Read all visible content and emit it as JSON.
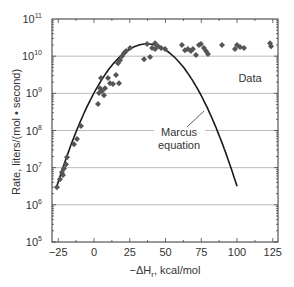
{
  "chart_data": {
    "type": "scatter",
    "title": "",
    "xlabel": "−ΔH",
    "xlabel_sub": "r",
    "xlabel_suffix": ", kcal/mol",
    "ylabel": "Rate, liters/(mol • second)",
    "xlim": [
      -25,
      125
    ],
    "ylim_log10": [
      5,
      11
    ],
    "yscale": "log",
    "grid": "horizontal major",
    "xticks": [
      -25,
      0,
      25,
      50,
      75,
      100,
      125
    ],
    "xtick_labels": [
      "−25",
      "0",
      "25",
      "50",
      "75",
      "100",
      "125"
    ],
    "yticks_log10": [
      5,
      6,
      7,
      8,
      9,
      10,
      11
    ],
    "ytick_labels": [
      {
        "base": "10",
        "exp": "5"
      },
      {
        "base": "10",
        "exp": "6"
      },
      {
        "base": "10",
        "exp": "7"
      },
      {
        "base": "10",
        "exp": "8"
      },
      {
        "base": "10",
        "exp": "9"
      },
      {
        "base": "10",
        "exp": "10"
      },
      {
        "base": "10",
        "exp": "11"
      }
    ],
    "series": [
      {
        "name": "Data",
        "kind": "scatter",
        "marker": "diamond",
        "color": "#555555",
        "points_x_log10y": [
          [
            -25.9,
            6.47
          ],
          [
            -23.8,
            6.69
          ],
          [
            -22.4,
            6.88
          ],
          [
            -21.7,
            6.8
          ],
          [
            -21.0,
            6.98
          ],
          [
            -19.6,
            7.09
          ],
          [
            -18.9,
            7.28
          ],
          [
            -14.0,
            7.63
          ],
          [
            -11.9,
            7.77
          ],
          [
            -9.1,
            8.12
          ],
          [
            2.8,
            8.71
          ],
          [
            3.5,
            9.01
          ],
          [
            4.2,
            9.14
          ],
          [
            5.6,
            9.06
          ],
          [
            7.0,
            8.95
          ],
          [
            7.7,
            9.14
          ],
          [
            4.9,
            9.41
          ],
          [
            9.8,
            9.41
          ],
          [
            11.2,
            9.27
          ],
          [
            13.3,
            9.25
          ],
          [
            15.4,
            9.49
          ],
          [
            17.5,
            9.27
          ],
          [
            16.8,
            9.81
          ],
          [
            18.2,
            9.89
          ],
          [
            19.6,
            10.0
          ],
          [
            21.0,
            10.08
          ],
          [
            22.4,
            10.14
          ],
          [
            25.2,
            10.22
          ],
          [
            35.0,
            9.92
          ],
          [
            39.2,
            9.98
          ],
          [
            37.1,
            10.33
          ],
          [
            40.6,
            10.22
          ],
          [
            42.7,
            10.35
          ],
          [
            42.7,
            10.19
          ],
          [
            44.8,
            10.27
          ],
          [
            46.9,
            10.22
          ],
          [
            49.7,
            10.19
          ],
          [
            61.5,
            10.3
          ],
          [
            63.6,
            10.16
          ],
          [
            65.7,
            10.19
          ],
          [
            67.8,
            10.14
          ],
          [
            69.2,
            10.19
          ],
          [
            71.3,
            10.03
          ],
          [
            73.4,
            10.3
          ],
          [
            74.8,
            10.33
          ],
          [
            76.9,
            10.22
          ],
          [
            78.3,
            10.14
          ],
          [
            79.7,
            10.06
          ],
          [
            89.5,
            10.3
          ],
          [
            98.6,
            10.19
          ],
          [
            100.0,
            10.3
          ],
          [
            102.1,
            10.25
          ],
          [
            104.9,
            10.22
          ],
          [
            123.1,
            10.35
          ],
          [
            123.8,
            10.27
          ]
        ]
      },
      {
        "name": "Marcus equation",
        "kind": "line",
        "color": "#1a1a1a",
        "model": "parabola in log10(rate)",
        "peak_x": 37,
        "peak_log10y": 10.33,
        "curvature": 0.000965,
        "x_range": [
          -26,
          100
        ]
      }
    ],
    "annotations": [
      {
        "text": "Data"
      },
      {
        "text_lines": [
          "Marcus",
          "equation"
        ]
      }
    ]
  }
}
